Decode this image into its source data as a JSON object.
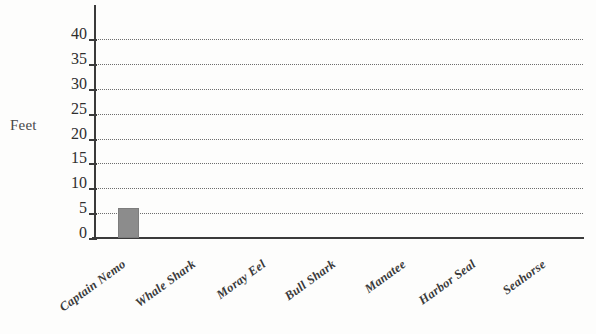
{
  "chart_data": {
    "type": "bar",
    "title": "",
    "subtitle": "",
    "xlabel": "",
    "ylabel": "Feet",
    "categories": [
      "Captain Nemo",
      "Whale Shark",
      "Moray Eel",
      "Bull Shark",
      "Manatee",
      "Harbor Seal",
      "Seahorse"
    ],
    "values": [
      6,
      0,
      0,
      0,
      0,
      0,
      0
    ],
    "ylim": [
      0,
      40
    ],
    "ytick_step": 5,
    "ytick_labels": [
      "0",
      "5",
      "10",
      "15",
      "20",
      "25",
      "30",
      "35",
      "40"
    ],
    "ytick_values": [
      0,
      5,
      10,
      15,
      20,
      25,
      30,
      35,
      40
    ],
    "grid": true,
    "grid_style": "dotted",
    "grid_axis": "y",
    "legend": false,
    "legend_position": "none",
    "bar_color": "#8c8c8c",
    "axis_color": "#3b3b3b",
    "grid_color": "#6d6d6d",
    "background_color": "#fdfdfc",
    "text_color": "#2e2e2e",
    "xlabel_rotation_deg": -36
  }
}
